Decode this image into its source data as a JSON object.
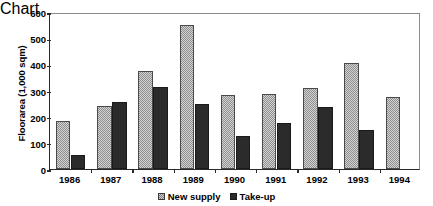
{
  "chart_data": {
    "type": "bar",
    "title": "",
    "xlabel": "",
    "ylabel": "Floorarea (1,000 sqm)",
    "categories": [
      "1986",
      "1987",
      "1988",
      "1989",
      "1990",
      "1991",
      "1992",
      "1993",
      "1994"
    ],
    "series": [
      {
        "name": "New supply",
        "values": [
          185,
          240,
          375,
          550,
          283,
          288,
          310,
          407,
          277
        ]
      },
      {
        "name": "Take-up",
        "values": [
          55,
          258,
          312,
          250,
          127,
          175,
          238,
          148,
          null
        ]
      }
    ],
    "ylim": [
      0,
      600
    ],
    "yticks": [
      0,
      100,
      200,
      300,
      400,
      500,
      600
    ],
    "ytick_labels": [
      "0",
      "100",
      "200",
      "300",
      "400",
      "500",
      "600"
    ],
    "grid": false,
    "legend_position": "bottom-center",
    "colors": {
      "new_supply": "#d2d2d2",
      "take_up": "#2b2b2b",
      "axis": "#2a2a2a",
      "background": "#ffffff"
    }
  },
  "legend": {
    "items": [
      {
        "label": "New supply",
        "icon": "checkered-square-swatch"
      },
      {
        "label": "Take-up",
        "icon": "solid-square-swatch"
      }
    ]
  }
}
